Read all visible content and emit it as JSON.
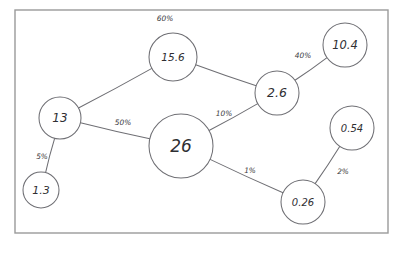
{
  "diagram": {
    "title": "",
    "frame": {
      "x": 15,
      "y": 10,
      "width": 373,
      "height": 223
    },
    "style": {
      "background": "#ffffff",
      "frame_stroke": "#9a9a9a",
      "node_stroke": "#6f6f74",
      "node_fill": "#ffffff",
      "edge_stroke": "#6f6f74",
      "node_text": "#2f2f33",
      "edge_text": "#3a3a3e"
    },
    "nodes": [
      {
        "id": "n13",
        "label": "13",
        "cx": 60,
        "cy": 118,
        "r": 21,
        "font_size": 12
      },
      {
        "id": "n1_3",
        "label": "1.3",
        "cx": 41,
        "cy": 190,
        "r": 18,
        "font_size": 11
      },
      {
        "id": "n15_6",
        "label": "15.6",
        "cx": 173,
        "cy": 57,
        "r": 24,
        "font_size": 10.5
      },
      {
        "id": "n26",
        "label": "26",
        "cx": 181,
        "cy": 146,
        "r": 32,
        "font_size": 17
      },
      {
        "id": "n2_6",
        "label": "2.6",
        "cx": 277,
        "cy": 93,
        "r": 22,
        "font_size": 12.5
      },
      {
        "id": "n10_4",
        "label": "10.4",
        "cx": 345,
        "cy": 45,
        "r": 22,
        "font_size": 11.5
      },
      {
        "id": "n0_54",
        "label": "0.54",
        "cx": 352,
        "cy": 128,
        "r": 22,
        "font_size": 10
      },
      {
        "id": "n0_26",
        "label": "0.26",
        "cx": 303,
        "cy": 202,
        "r": 22,
        "font_size": 10
      }
    ],
    "edges": [
      {
        "id": "e13-15_6",
        "from": "n13",
        "to": "n15_6",
        "label": "60%",
        "label_x": 165,
        "label_y": 19
      },
      {
        "id": "e13-26",
        "from": "n13",
        "to": "n26",
        "label": "50%",
        "label_x": 123,
        "label_y": 123
      },
      {
        "id": "e13-1_3",
        "from": "n13",
        "to": "n1_3",
        "label": "5%",
        "label_x": 42,
        "label_y": 157
      },
      {
        "id": "e15_6-2_6",
        "from": "n15_6",
        "to": "n2_6",
        "label": "",
        "label_x": 0,
        "label_y": 0
      },
      {
        "id": "e26-2_6",
        "from": "n26",
        "to": "n2_6",
        "label": "10%",
        "label_x": 224,
        "label_y": 114
      },
      {
        "id": "e2_6-10_4",
        "from": "n2_6",
        "to": "n10_4",
        "label": "40%",
        "label_x": 303,
        "label_y": 56
      },
      {
        "id": "e26-0_26",
        "from": "n26",
        "to": "n0_26",
        "label": "1%",
        "label_x": 250,
        "label_y": 171
      },
      {
        "id": "e0_26-0_54",
        "from": "n0_26",
        "to": "n0_54",
        "label": "2%",
        "label_x": 343,
        "label_y": 172
      }
    ]
  }
}
